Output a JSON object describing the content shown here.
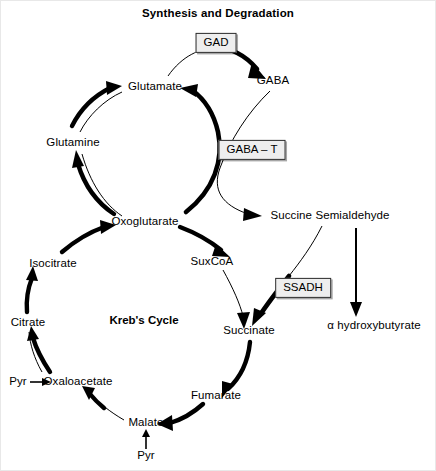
{
  "diagram": {
    "title": "Synthesis and Degradation",
    "cycle_caption": "Kreb's Cycle",
    "width": 436,
    "height": 471,
    "background_color": "#ffffff",
    "line_color": "#000000",
    "enzyme_box_fill": "#eeeeee"
  },
  "metabolites": [
    {
      "id": "glutamate",
      "label": "Glutamate",
      "x": 155,
      "y": 87
    },
    {
      "id": "glutamine",
      "label": "Glutamine",
      "x": 73,
      "y": 143
    },
    {
      "id": "oxoglutarate",
      "label": "Oxoglutarate",
      "x": 145,
      "y": 222
    },
    {
      "id": "gaba",
      "label": "GABA",
      "x": 273,
      "y": 81
    },
    {
      "id": "ssa",
      "label": "Succine Semialdehyde",
      "x": 330,
      "y": 216
    },
    {
      "id": "ghb",
      "label": "α hydroxybutyrate",
      "x": 374,
      "y": 326
    },
    {
      "id": "suxcoa",
      "label": "SuxCoA",
      "x": 212,
      "y": 262
    },
    {
      "id": "succinate",
      "label": "Succinate",
      "x": 249,
      "y": 331
    },
    {
      "id": "fumarate",
      "label": "Fumarate",
      "x": 216,
      "y": 396
    },
    {
      "id": "malate",
      "label": "Malate",
      "x": 146,
      "y": 423
    },
    {
      "id": "pyr_malate",
      "label": "Pyr",
      "x": 146,
      "y": 456
    },
    {
      "id": "oxaloacetate",
      "label": "Oxaloacetate",
      "x": 78,
      "y": 382
    },
    {
      "id": "pyr_oaa",
      "label": "Pyr",
      "x": 18,
      "y": 382
    },
    {
      "id": "citrate",
      "label": "Citrate",
      "x": 28,
      "y": 323
    },
    {
      "id": "isocitrate",
      "label": "Isocitrate",
      "x": 53,
      "y": 264
    }
  ],
  "enzymes": [
    {
      "id": "gad",
      "label": "GAD",
      "x": 216,
      "y": 43
    },
    {
      "id": "gaba_t",
      "label": "GABA – T",
      "x": 252,
      "y": 150
    },
    {
      "id": "ssadh",
      "label": "SSADH",
      "x": 303,
      "y": 288
    }
  ],
  "reactions": [
    {
      "id": "glutamate-to-gaba",
      "from": "Glutamate",
      "to": "GABA",
      "enzyme": "GAD",
      "style": "thick"
    },
    {
      "id": "gaba-to-ssa",
      "from": "GABA",
      "to": "Succine Semialdehyde",
      "enzyme": "GABA – T",
      "style": "thin"
    },
    {
      "id": "oxoglutarate-to-glutamate",
      "from": "Oxoglutarate",
      "to": "Glutamate",
      "enzyme": "GABA – T",
      "style": "thick"
    },
    {
      "id": "ssa-to-ghb",
      "from": "Succine Semialdehyde",
      "to": "α hydroxybutyrate",
      "enzyme": "",
      "style": "thin"
    },
    {
      "id": "ssa-to-succinate",
      "from": "Succine Semialdehyde",
      "to": "Succinate",
      "enzyme": "SSADH",
      "style": "thick"
    },
    {
      "id": "glutamate-to-glutamine",
      "from": "Glutamate",
      "to": "Glutamine",
      "enzyme": "",
      "style": "thin"
    },
    {
      "id": "glutamine-to-oxoglutarate",
      "from": "Glutamine",
      "to": "Oxoglutarate",
      "enzyme": "",
      "style": "thin"
    },
    {
      "id": "oxoglutarate-to-glutamine",
      "from": "Oxoglutarate",
      "to": "Glutamine",
      "enzyme": "",
      "style": "thick"
    },
    {
      "id": "isocitrate-to-oxoglutarate",
      "from": "Isocitrate",
      "to": "Oxoglutarate",
      "enzyme": "",
      "style": "thick"
    },
    {
      "id": "oxoglutarate-to-suxcoa",
      "from": "Oxoglutarate",
      "to": "SuxCoA",
      "enzyme": "",
      "style": "thick"
    },
    {
      "id": "suxcoa-to-succinate",
      "from": "SuxCoA",
      "to": "Succinate",
      "enzyme": "",
      "style": "thin"
    },
    {
      "id": "succinate-to-fumarate",
      "from": "Succinate",
      "to": "Fumarate",
      "enzyme": "",
      "style": "thick"
    },
    {
      "id": "fumarate-to-malate",
      "from": "Fumarate",
      "to": "Malate",
      "enzyme": "",
      "style": "thick"
    },
    {
      "id": "malate-to-oxaloacetate",
      "from": "Malate",
      "to": "Oxaloacetate",
      "enzyme": "",
      "style": "thick"
    },
    {
      "id": "pyr-to-malate",
      "from": "Pyr",
      "to": "Malate",
      "enzyme": "",
      "style": "thin"
    },
    {
      "id": "pyr-to-oxaloacetate",
      "from": "Pyr",
      "to": "Oxaloacetate",
      "enzyme": "",
      "style": "thin"
    },
    {
      "id": "oxaloacetate-to-citrate",
      "from": "Oxaloacetate",
      "to": "Citrate",
      "enzyme": "",
      "style": "thick"
    },
    {
      "id": "citrate-to-isocitrate",
      "from": "Citrate",
      "to": "Isocitrate",
      "enzyme": "",
      "style": "thick"
    }
  ]
}
